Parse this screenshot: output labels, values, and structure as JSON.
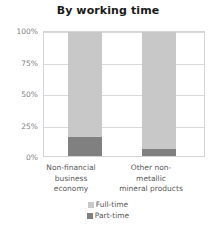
{
  "chart_data": {
    "type": "bar",
    "title": "By working time",
    "xlabel": "",
    "ylabel": "",
    "ylim": [
      0,
      100
    ],
    "stacked": true,
    "stacked_percent": true,
    "grid": true,
    "legend_position": "bottom",
    "categories": [
      "Non-financial business economy",
      "Other non-metallic mineral products"
    ],
    "category_lines": [
      "Non-financial\nbusiness economy",
      "Other non-metallic\nmineral products"
    ],
    "ticks": [
      "0%",
      "25%",
      "50%",
      "75%",
      "100%"
    ],
    "tick_values": [
      0,
      25,
      50,
      75,
      100
    ],
    "series": [
      {
        "name": "Full-time",
        "color": "#c8c8c8",
        "values": [
          85,
          94
        ]
      },
      {
        "name": "Part-time",
        "color": "#808080",
        "values": [
          15,
          6
        ]
      }
    ]
  },
  "legend": {
    "items": [
      {
        "label": "Full-time",
        "color": "#c8c8c8"
      },
      {
        "label": "Part-time",
        "color": "#808080"
      }
    ]
  }
}
